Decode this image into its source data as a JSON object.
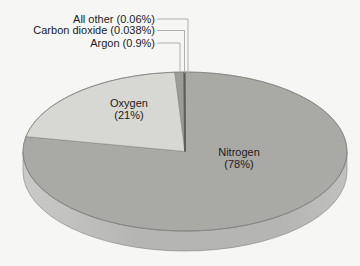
{
  "chart_data": {
    "type": "pie",
    "title": "",
    "style": "3d-ellipse",
    "legend_position": "none",
    "start_angle_deg": 90,
    "direction": "clockwise",
    "slices": [
      {
        "label": "Nitrogen",
        "value": 78,
        "display": "Nitrogen (78%)",
        "color": "#a9a9a6",
        "label_placement": "inside"
      },
      {
        "label": "Oxygen",
        "value": 21,
        "display": "Oxygen (21%)",
        "color": "#d7d7d3",
        "label_placement": "inside"
      },
      {
        "label": "Argon",
        "value": 0.9,
        "display": "Argon (0.9%)",
        "color": "#9b9b98",
        "label_placement": "callout"
      },
      {
        "label": "Carbon dioxide",
        "value": 0.038,
        "display": "Carbon dioxide (0.038%)",
        "color": "#5d5d5b",
        "label_placement": "callout"
      },
      {
        "label": "All other",
        "value": 0.06,
        "display": "All other (0.06%)",
        "color": "#5d5d5b",
        "label_placement": "callout"
      }
    ],
    "labels": {
      "inside": [
        {
          "line1": "Oxygen",
          "line2": "(21%)"
        },
        {
          "line1": "Nitrogen",
          "line2": "(78%)"
        }
      ],
      "callouts": [
        {
          "text": "All other (0.06%)"
        },
        {
          "text": "Carbon dioxide (0.038%)"
        },
        {
          "text": "Argon (0.9%)"
        }
      ]
    },
    "colors": {
      "background": "#f6f6f4",
      "side": "#b5b5b3",
      "side_light": "#cacac8",
      "side_right": "#c0c0be",
      "outline": "#82827f",
      "slice_border": "#7f7f7d",
      "divider_dark": "#5d5d5b",
      "leader_line": "#b0b0ae",
      "text": "#1c1c1c"
    }
  }
}
